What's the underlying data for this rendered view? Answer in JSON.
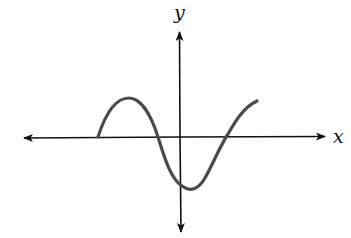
{
  "figure": {
    "type": "function-graph",
    "axes": {
      "x_label": "x",
      "y_label": "y",
      "axis_color": "#111111",
      "arrows": [
        "left",
        "right",
        "up",
        "down"
      ]
    },
    "curve": {
      "color": "#4a4a4a",
      "shape": "wave",
      "start_point_on_x_axis": true,
      "features": [
        "local maximum left of y-axis",
        "local minimum just right of y-axis",
        "negative y-intercept",
        "two x-intercepts besides starting point",
        "ends rising"
      ]
    }
  }
}
